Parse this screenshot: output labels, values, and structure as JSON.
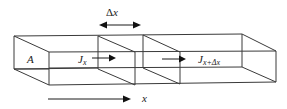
{
  "diagram": {
    "type": "flux through control volume slab",
    "labels": {
      "area": "A",
      "flux_in_base": "J",
      "flux_in_sub": "x",
      "flux_out_base": "J",
      "flux_out_sub": "x+Δx",
      "delta_x_symbol": "Δ",
      "delta_x_var": "x",
      "axis": "x"
    },
    "elements": [
      {
        "id": "prism",
        "description": "long rectangular bar drawn in oblique perspective"
      },
      {
        "id": "slice-1",
        "description": "cross-section plane at x"
      },
      {
        "id": "slice-2",
        "description": "cross-section plane at x+Δx"
      },
      {
        "id": "delta-x-arrow",
        "description": "double-headed arrow spanning the slab thickness"
      },
      {
        "id": "flux-in-arrow",
        "description": "arrow indicating flux J_x entering slab"
      },
      {
        "id": "flux-out-arrow",
        "description": "arrow indicating flux J_{x+Δx} leaving slab"
      },
      {
        "id": "x-axis-arrow",
        "description": "arrow indicating positive x direction"
      }
    ],
    "colors": {
      "line": "#3a3a3a",
      "arrow": "#111111",
      "text": "#222222",
      "background": "#ffffff"
    }
  }
}
